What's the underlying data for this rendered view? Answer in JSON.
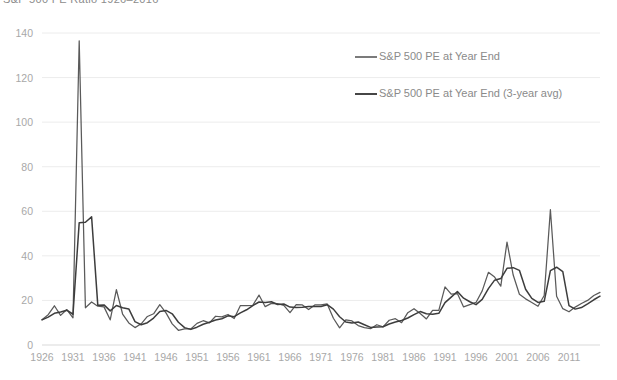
{
  "title": "S&P 500 PE Ratio 1926–2016",
  "colors": {
    "series1": "#5a5a5a",
    "series2": "#3d3d3d",
    "grid": "#ececec",
    "axis_text": "#a8a8a8",
    "legend_text": "#8a8a8a",
    "background": "#ffffff"
  },
  "legend": {
    "position": "top-right",
    "entries": [
      {
        "label": "S&P 500 PE at Year End",
        "color": "#5a5a5a"
      },
      {
        "label": "S&P 500 PE at Year End (3-year avg)",
        "color": "#3d3d3d"
      }
    ]
  },
  "chart_data": {
    "type": "line",
    "title": "S&P 500 PE Ratio 1926–2016",
    "xlabel": "",
    "ylabel": "",
    "ylim": [
      0,
      140
    ],
    "yticks": [
      0,
      20,
      40,
      60,
      80,
      100,
      120,
      140
    ],
    "ytick_labels": [
      "0",
      "20",
      "40",
      "60",
      "80",
      "100",
      "120",
      "140"
    ],
    "xlim": [
      1926,
      2016
    ],
    "xticks": [
      1926,
      1931,
      1936,
      1941,
      1946,
      1951,
      1956,
      1961,
      1966,
      1971,
      1976,
      1981,
      1986,
      1991,
      1996,
      2001,
      2006,
      2011
    ],
    "xtick_labels": [
      "1926",
      "1931",
      "1936",
      "1941",
      "1946",
      "1951",
      "1956",
      "1961",
      "1966",
      "1971",
      "1976",
      "1981",
      "1986",
      "1991",
      "1996",
      "2001",
      "2006",
      "2011"
    ],
    "grid": true,
    "grid_axis": "y",
    "legend_position": "top-right",
    "x": [
      1926,
      1927,
      1928,
      1929,
      1930,
      1931,
      1932,
      1933,
      1934,
      1935,
      1936,
      1937,
      1938,
      1939,
      1940,
      1941,
      1942,
      1943,
      1944,
      1945,
      1946,
      1947,
      1948,
      1949,
      1950,
      1951,
      1952,
      1953,
      1954,
      1955,
      1956,
      1957,
      1958,
      1959,
      1960,
      1961,
      1962,
      1963,
      1964,
      1965,
      1966,
      1967,
      1968,
      1969,
      1970,
      1971,
      1972,
      1973,
      1974,
      1975,
      1976,
      1977,
      1978,
      1979,
      1980,
      1981,
      1982,
      1983,
      1984,
      1985,
      1986,
      1987,
      1988,
      1989,
      1990,
      1991,
      1992,
      1993,
      1994,
      1995,
      1996,
      1997,
      1998,
      1999,
      2000,
      2001,
      2002,
      2003,
      2004,
      2005,
      2006,
      2007,
      2008,
      2009,
      2010,
      2011,
      2012,
      2013,
      2014,
      2015,
      2016
    ],
    "series": [
      {
        "name": "S&P 500 PE at Year End",
        "color": "#5a5a5a",
        "values": [
          11.3,
          13.6,
          17.6,
          13.3,
          15.9,
          12.2,
          136.5,
          16.7,
          19.3,
          17.4,
          17.1,
          11.3,
          24.8,
          13.9,
          9.9,
          7.8,
          9.5,
          12.8,
          14.0,
          18.1,
          14.4,
          9.5,
          6.6,
          7.2,
          7.2,
          9.7,
          10.9,
          9.9,
          12.9,
          12.6,
          13.7,
          11.9,
          17.7,
          17.7,
          17.8,
          22.4,
          17.2,
          18.7,
          18.6,
          17.8,
          14.5,
          18.1,
          18.0,
          15.9,
          18.0,
          18.0,
          18.4,
          12.0,
          7.7,
          11.3,
          10.8,
          8.7,
          7.8,
          7.3,
          9.1,
          8.1,
          11.1,
          11.8,
          10.0,
          14.5,
          16.3,
          14.1,
          11.7,
          15.5,
          15.5,
          26.1,
          22.8,
          23.1,
          17.1,
          18.1,
          19.1,
          24.3,
          32.6,
          30.5,
          26.4,
          46.2,
          31.4,
          22.8,
          20.7,
          19.1,
          17.4,
          22.2,
          60.7,
          21.9,
          16.3,
          14.9,
          17.0,
          18.6,
          20.0,
          22.2,
          23.6
        ]
      },
      {
        "name": "S&P 500 PE at Year End (3-year avg)",
        "color": "#3d3d3d",
        "values": [
          11.3,
          12.5,
          14.2,
          14.8,
          15.6,
          13.8,
          54.9,
          55.1,
          57.5,
          17.8,
          18.0,
          15.3,
          17.7,
          16.7,
          16.2,
          10.5,
          9.1,
          10.0,
          12.1,
          15.0,
          15.5,
          14.0,
          10.2,
          7.8,
          7.0,
          8.0,
          9.3,
          10.2,
          11.2,
          11.8,
          13.1,
          12.7,
          14.4,
          15.8,
          17.7,
          19.3,
          19.1,
          19.4,
          18.2,
          18.4,
          17.0,
          16.8,
          16.9,
          17.3,
          17.3,
          17.3,
          18.1,
          16.1,
          12.7,
          10.3,
          9.9,
          10.3,
          9.1,
          7.9,
          8.1,
          8.2,
          9.4,
          10.3,
          11.0,
          12.1,
          13.6,
          15.0,
          14.0,
          13.8,
          14.2,
          19.0,
          21.5,
          24.0,
          21.0,
          19.4,
          18.1,
          20.5,
          25.3,
          29.1,
          29.8,
          34.4,
          34.7,
          33.5,
          25.0,
          20.9,
          19.1,
          19.6,
          33.4,
          34.9,
          32.9,
          17.7,
          16.1,
          16.8,
          18.5,
          20.3,
          21.9
        ]
      }
    ]
  }
}
